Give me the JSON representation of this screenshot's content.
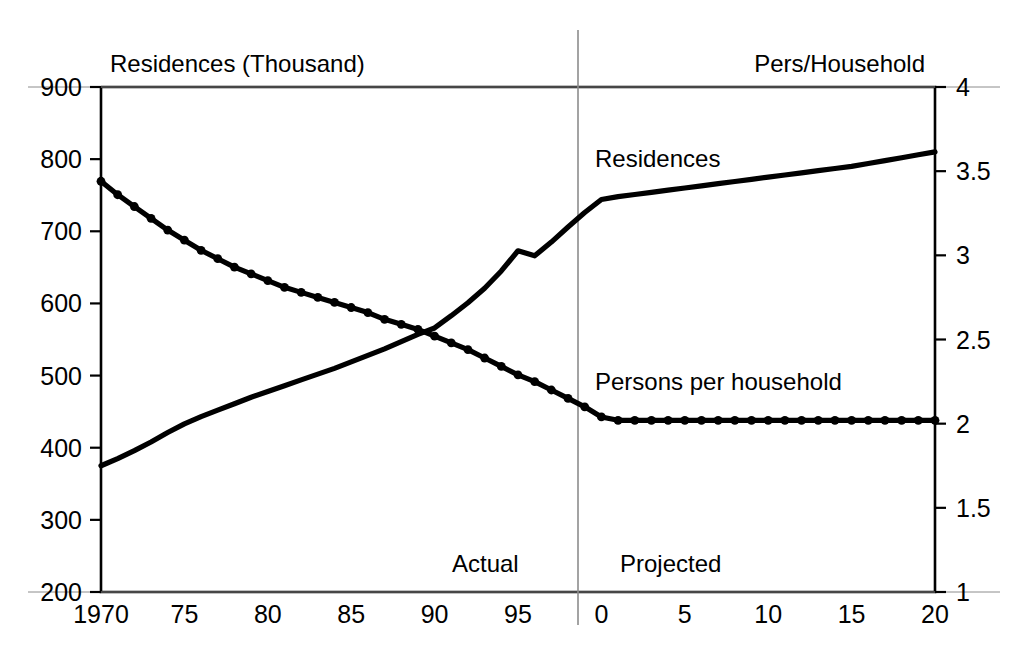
{
  "figure": {
    "background_color": "#ffffff",
    "ink_color": "#000000",
    "divider_color": "#8c8c8c",
    "scan_artifact_text": ""
  },
  "chart_data": {
    "type": "line",
    "title": "",
    "xlabel": "",
    "grid": false,
    "legend_position": "inline-annotations",
    "x_axis": {
      "tick_labels": [
        "1970",
        "75",
        "80",
        "85",
        "90",
        "95",
        "0",
        "5",
        "10",
        "15",
        "20"
      ],
      "tick_values": [
        1970,
        1975,
        1980,
        1985,
        1990,
        1995,
        2000,
        2005,
        2010,
        2015,
        2020
      ],
      "xlim": [
        1970,
        2020
      ]
    },
    "left_axis": {
      "label": "Residences (Thousand)",
      "tick_labels": [
        "900",
        "800",
        "700",
        "600",
        "500",
        "400",
        "300",
        "200"
      ],
      "tick_values": [
        900,
        800,
        700,
        600,
        500,
        400,
        300,
        200
      ],
      "ylim": [
        200,
        900
      ]
    },
    "right_axis": {
      "label": "Pers/Household",
      "tick_labels": [
        "4",
        "3.5",
        "3",
        "2.5",
        "2",
        "1.5",
        "1"
      ],
      "tick_values": [
        4,
        3.5,
        3,
        2.5,
        2,
        1.5,
        1
      ],
      "ylim": [
        1,
        4
      ]
    },
    "divider": {
      "x_value": 1999,
      "left_label": "Actual",
      "right_label": "Projected"
    },
    "series": [
      {
        "name": "Residences",
        "axis": "left",
        "label": "Residences",
        "markers": false,
        "x": [
          1970,
          1971,
          1972,
          1973,
          1974,
          1975,
          1976,
          1977,
          1978,
          1979,
          1980,
          1981,
          1982,
          1983,
          1984,
          1985,
          1986,
          1987,
          1988,
          1989,
          1990,
          1991,
          1992,
          1993,
          1994,
          1995,
          1996,
          1997,
          1998,
          1999,
          2000,
          2001,
          2002,
          2003,
          2004,
          2005,
          2006,
          2007,
          2008,
          2009,
          2010,
          2011,
          2012,
          2013,
          2014,
          2015,
          2016,
          2017,
          2018,
          2019,
          2020
        ],
        "values": [
          375,
          385,
          396,
          408,
          421,
          433,
          443,
          452,
          461,
          470,
          478,
          486,
          494,
          502,
          510,
          519,
          528,
          537,
          547,
          557,
          566,
          583,
          601,
          621,
          645,
          673,
          666,
          685,
          706,
          726,
          744,
          748,
          751,
          754,
          757,
          760,
          763,
          766,
          769,
          772,
          775,
          778,
          781,
          784,
          787,
          790,
          794,
          798,
          802,
          806,
          810
        ]
      },
      {
        "name": "Persons per household",
        "axis": "right",
        "label": "Persons per household",
        "markers": true,
        "x": [
          1970,
          1971,
          1972,
          1973,
          1974,
          1975,
          1976,
          1977,
          1978,
          1979,
          1980,
          1981,
          1982,
          1983,
          1984,
          1985,
          1986,
          1987,
          1988,
          1989,
          1990,
          1991,
          1992,
          1993,
          1994,
          1995,
          1996,
          1997,
          1998,
          1999,
          2000,
          2001,
          2002,
          2003,
          2004,
          2005,
          2006,
          2007,
          2008,
          2009,
          2010,
          2011,
          2012,
          2013,
          2014,
          2015,
          2016,
          2017,
          2018,
          2019,
          2020
        ],
        "values": [
          3.44,
          3.36,
          3.29,
          3.22,
          3.15,
          3.09,
          3.03,
          2.98,
          2.93,
          2.89,
          2.85,
          2.81,
          2.78,
          2.75,
          2.72,
          2.69,
          2.66,
          2.62,
          2.59,
          2.56,
          2.52,
          2.48,
          2.44,
          2.39,
          2.34,
          2.29,
          2.25,
          2.2,
          2.15,
          2.1,
          2.04,
          2.02,
          2.02,
          2.02,
          2.02,
          2.02,
          2.02,
          2.02,
          2.02,
          2.02,
          2.02,
          2.02,
          2.02,
          2.02,
          2.02,
          2.02,
          2.02,
          2.02,
          2.02,
          2.02,
          2.02
        ]
      }
    ],
    "annotations": [
      {
        "text": "Residences",
        "x": 2000,
        "y_axis": "left",
        "y": 795
      },
      {
        "text": "Persons per household",
        "x": 2000,
        "y_axis": "left",
        "y": 500
      },
      {
        "text": "Actual",
        "x": 1993,
        "y_axis": "left",
        "y": 255
      },
      {
        "text": "Projected",
        "x": 2003,
        "y_axis": "left",
        "y": 255
      }
    ]
  }
}
